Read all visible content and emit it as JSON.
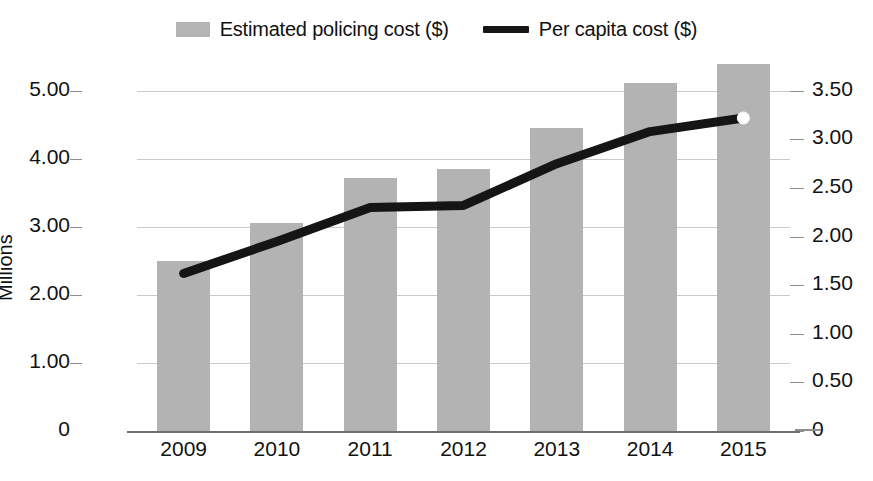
{
  "legend": {
    "items": [
      {
        "label": "Estimated policing cost ($)",
        "marker": "bar-swatch",
        "color": "#b3b3b3"
      },
      {
        "label": "Per capita cost ($)",
        "marker": "line-swatch",
        "color": "#151515"
      }
    ]
  },
  "axes": {
    "left": {
      "title": "Millions",
      "ticks": [
        "5.00",
        "4.00",
        "3.00",
        "2.00",
        "1.00",
        "0"
      ],
      "values": [
        5,
        4,
        3,
        2,
        1,
        0
      ],
      "min": 0,
      "max": 5.32
    },
    "right": {
      "ticks": [
        "3.50",
        "3.00",
        "2.50",
        "2.00",
        "1.50",
        "1.00",
        "0.50",
        "0"
      ],
      "values": [
        3.5,
        3.0,
        2.5,
        2.0,
        1.5,
        1.0,
        0.5,
        0
      ],
      "min": 0,
      "max": 3.724
    },
    "bottom": {
      "ticks": [
        "2009",
        "2010",
        "2011",
        "2012",
        "2013",
        "2014",
        "2015"
      ]
    }
  },
  "chart_data": {
    "type": "bar",
    "title": "",
    "xlabel": "",
    "ylabel": "Millions",
    "categories": [
      "2009",
      "2010",
      "2011",
      "2012",
      "2013",
      "2014",
      "2015"
    ],
    "grid": true,
    "legend_position": "top-center",
    "ylim": [
      0,
      5.32
    ],
    "y2lim": [
      0,
      3.724
    ],
    "series": [
      {
        "name": "Estimated policing cost ($)",
        "type": "bar",
        "axis": "left",
        "color": "#b3b3b3",
        "values": [
          2.5,
          3.05,
          3.72,
          3.85,
          4.45,
          5.12,
          5.4
        ]
      },
      {
        "name": "Per capita cost ($)",
        "type": "line",
        "axis": "right",
        "color": "#151515",
        "values": [
          1.62,
          1.95,
          2.3,
          2.32,
          2.75,
          3.08,
          3.22
        ]
      }
    ]
  }
}
